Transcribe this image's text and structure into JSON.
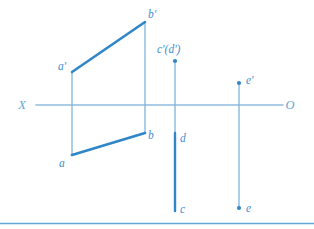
{
  "figure": {
    "width": 314,
    "height": 229,
    "background_color": "#ffffff"
  },
  "colors": {
    "thick_line": "#2f86c8",
    "thin_line": "#7fb4dd",
    "axis_line": "#8fbcdf",
    "label_text": "#3f8fce",
    "axis_label_text": "#5fa3d6",
    "footer_rule": "#64a8d8",
    "point_dot": "#2f86c8"
  },
  "axis": {
    "name": "ground-line",
    "left_label": "X",
    "right_label": "O",
    "y": 105,
    "x_start": 36,
    "x_end": 283,
    "left_label_x": 22,
    "left_label_y": 109,
    "right_label_x": 290,
    "right_label_y": 109
  },
  "labels": [
    {
      "id": "a-prime",
      "text": "a'",
      "x": 58,
      "y": 70
    },
    {
      "id": "b-prime",
      "text": "b'",
      "x": 148,
      "y": 18
    },
    {
      "id": "a",
      "text": "a",
      "x": 59,
      "y": 167
    },
    {
      "id": "b",
      "text": "b",
      "x": 148,
      "y": 139
    },
    {
      "id": "c-prime-d-prime",
      "text": "c'(d')",
      "x": 157,
      "y": 53
    },
    {
      "id": "d",
      "text": "d",
      "x": 180,
      "y": 142
    },
    {
      "id": "c",
      "text": "c",
      "x": 180,
      "y": 213
    },
    {
      "id": "e-prime",
      "text": "e'",
      "x": 246,
      "y": 84
    },
    {
      "id": "e",
      "text": "e",
      "x": 246,
      "y": 212
    }
  ],
  "geometry": {
    "segments_thick": [
      {
        "id": "segment-a-prime-b-prime",
        "x1": 72,
        "y1": 72,
        "x2": 145,
        "y2": 22
      },
      {
        "id": "segment-a-b",
        "x1": 72,
        "y1": 155,
        "x2": 145,
        "y2": 133
      },
      {
        "id": "segment-d-c",
        "x1": 175,
        "y1": 133,
        "x2": 175,
        "y2": 211
      }
    ],
    "segments_thin": [
      {
        "id": "projector-a-prime-a",
        "x1": 72,
        "y1": 72,
        "x2": 72,
        "y2": 155
      },
      {
        "id": "projector-b-prime-b",
        "x1": 145,
        "y1": 22,
        "x2": 145,
        "y2": 133
      },
      {
        "id": "projector-c-prime-d",
        "x1": 175,
        "y1": 61,
        "x2": 175,
        "y2": 134
      },
      {
        "id": "projector-e-prime-e",
        "x1": 239,
        "y1": 83,
        "x2": 239,
        "y2": 208
      }
    ],
    "points": [
      {
        "id": "point-c-prime-d-prime",
        "x": 175,
        "y": 61,
        "r": 2.1
      },
      {
        "id": "point-e-prime",
        "x": 239,
        "y": 83,
        "r": 2.1
      },
      {
        "id": "point-e",
        "x": 239,
        "y": 208,
        "r": 2.1
      }
    ]
  },
  "footer_rule": {
    "y": 223.5,
    "x_start": 0,
    "x_end": 314
  }
}
